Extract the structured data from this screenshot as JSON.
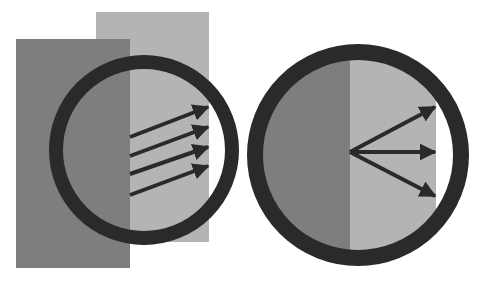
{
  "diagram": {
    "type": "illustration",
    "colors": {
      "background": "#ffffff",
      "dark_region": "#7e7e7e",
      "light_region": "#b4b4b4",
      "ring": "#2a2a2a",
      "arrow": "#2a2a2a"
    },
    "left_panel": {
      "dark_rect": {
        "x": 16,
        "y": 39,
        "w": 114,
        "h": 229
      },
      "light_rect": {
        "x": 96,
        "y": 12,
        "w": 113,
        "h": 230
      },
      "circle": {
        "cx": 144,
        "cy": 150,
        "r": 88,
        "stroke": 14
      },
      "arrows": [
        {
          "x1": 130,
          "y1": 137,
          "x2": 208,
          "y2": 107
        },
        {
          "x1": 130,
          "y1": 156,
          "x2": 208,
          "y2": 127
        },
        {
          "x1": 130,
          "y1": 174,
          "x2": 208,
          "y2": 147
        },
        {
          "x1": 130,
          "y1": 195,
          "x2": 208,
          "y2": 166
        }
      ]
    },
    "right_panel": {
      "circle": {
        "cx": 358,
        "cy": 155,
        "r": 103,
        "stroke": 16
      },
      "dark_split_x": 350,
      "light_right_x": 436,
      "arrows": [
        {
          "x1": 350,
          "y1": 152,
          "x2": 435,
          "y2": 107
        },
        {
          "x1": 350,
          "y1": 152,
          "x2": 435,
          "y2": 152
        },
        {
          "x1": 350,
          "y1": 152,
          "x2": 435,
          "y2": 196
        }
      ]
    }
  }
}
